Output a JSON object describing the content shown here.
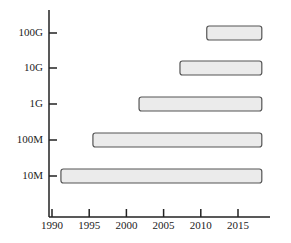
{
  "chart_data": {
    "type": "bar",
    "orientation": "horizontal-range",
    "title": "",
    "xlabel": "",
    "ylabel": "",
    "x_ticks": [
      "1990",
      "1995",
      "2000",
      "2005",
      "2010",
      "2015"
    ],
    "xlim": [
      1989.7,
      2019.5
    ],
    "categories": [
      "10M",
      "100M",
      "1G",
      "10G",
      "100G"
    ],
    "series": [
      {
        "name": "Availability period",
        "ranges": [
          {
            "category": "10M",
            "start": 1991.2,
            "end": 2018.2
          },
          {
            "category": "100M",
            "start": 1995.5,
            "end": 2018.2
          },
          {
            "category": "1G",
            "start": 2001.7,
            "end": 2018.2
          },
          {
            "category": "10G",
            "start": 2007.2,
            "end": 2018.2
          },
          {
            "category": "100G",
            "start": 2010.8,
            "end": 2018.2
          }
        ]
      }
    ],
    "grid": false,
    "legend": "none",
    "colors": {
      "bar_fill": "#ebebeb",
      "bar_stroke": "#555555",
      "axis": "#222222"
    }
  }
}
